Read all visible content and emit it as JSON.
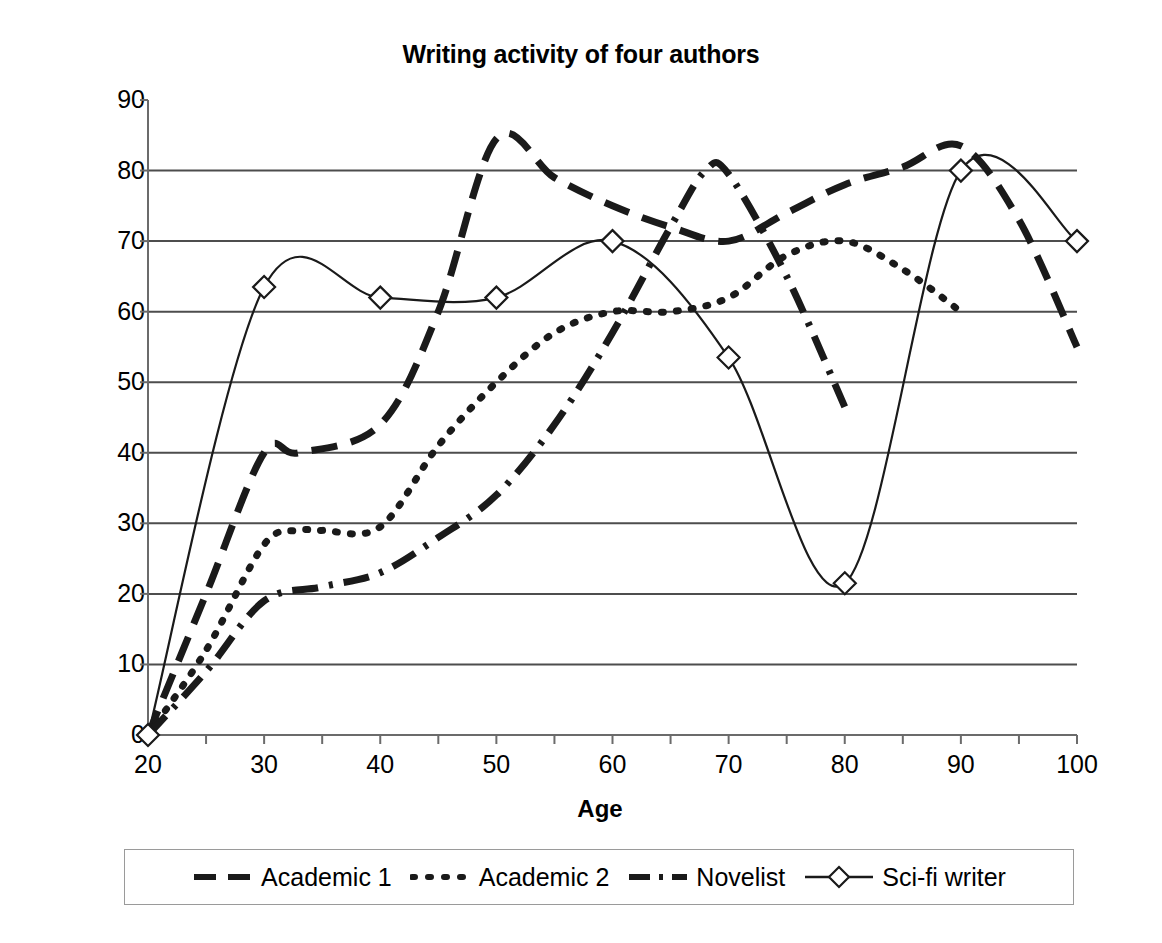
{
  "chart_data": {
    "type": "line",
    "title": "Writing activity of four authors",
    "xlabel": "Age",
    "ylabel": "Writing activity",
    "xlim": [
      20,
      100
    ],
    "ylim": [
      0,
      90
    ],
    "xticks": [
      20,
      30,
      40,
      50,
      60,
      70,
      80,
      90,
      100
    ],
    "yticks": [
      0,
      10,
      20,
      30,
      40,
      50,
      60,
      70,
      80,
      90
    ],
    "grid": "horizontal",
    "legend_position": "bottom",
    "series": [
      {
        "name": "Academic 1",
        "style": "long-dash",
        "marker": "none",
        "x": [
          20,
          25,
          30,
          33,
          40,
          45,
          50,
          55,
          60,
          65,
          70,
          75,
          80,
          85,
          90,
          95,
          100
        ],
        "values": [
          0,
          20,
          40,
          40,
          44,
          60,
          84.5,
          79,
          75,
          72,
          70,
          74,
          78,
          80.5,
          83.5,
          73,
          55
        ]
      },
      {
        "name": "Academic 2",
        "style": "dotted",
        "marker": "none",
        "x": [
          20,
          25,
          30,
          33,
          35,
          40,
          45,
          50,
          55,
          60,
          65,
          70,
          75,
          80,
          85,
          90
        ],
        "values": [
          0,
          12,
          27,
          29,
          29,
          29.5,
          41,
          50,
          57,
          60,
          60,
          62,
          68,
          70,
          66,
          60
        ]
      },
      {
        "name": "Novelist",
        "style": "dash-dot",
        "marker": "none",
        "x": [
          20,
          25,
          30,
          35,
          40,
          45,
          50,
          55,
          60,
          65,
          68,
          70,
          75,
          80
        ],
        "values": [
          0,
          9,
          19,
          21,
          23,
          28,
          34,
          44,
          57,
          72,
          80,
          79.5,
          65,
          46.5
        ]
      },
      {
        "name": "Sci-fi writer",
        "style": "solid",
        "marker": "diamond",
        "x": [
          20,
          30,
          40,
          50,
          60,
          70,
          80,
          90,
          100
        ],
        "values": [
          0,
          63.5,
          62,
          62,
          70,
          53.5,
          21.5,
          80,
          70
        ]
      }
    ]
  },
  "legend": {
    "items": [
      {
        "label": "Academic 1",
        "icon": "long-dash-line-icon"
      },
      {
        "label": "Academic 2",
        "icon": "dotted-line-icon"
      },
      {
        "label": "Novelist",
        "icon": "dash-dot-line-icon"
      },
      {
        "label": "Sci-fi writer",
        "icon": "solid-line-diamond-icon"
      }
    ]
  },
  "colors": {
    "ink": "#1a1a1a",
    "grid": "#4d4d4d",
    "axis": "#6b6b6b",
    "legend_border": "#9a9a9a",
    "background": "#ffffff"
  }
}
